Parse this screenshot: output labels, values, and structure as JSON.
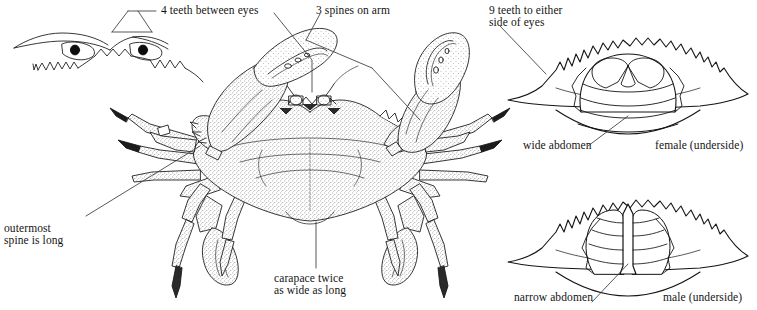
{
  "figure": {
    "background_color": "#ffffff",
    "ink_color": "#141414"
  },
  "labels": {
    "teeth_between_eyes": "4 teeth between eyes",
    "spines_on_arm": "3 spines on arm",
    "teeth_either_side_line1": "9 teeth to either",
    "teeth_either_side_line2": "side of eyes",
    "outermost_spine_line1": "outermost",
    "outermost_spine_line2": "spine is long",
    "carapace_line1": "carapace twice",
    "carapace_line2": "as wide as long",
    "wide_abdomen": "wide abdomen",
    "female_underside": "female (underside)",
    "narrow_abdomen": "narrow abdomen",
    "male_underside": "male (underside)"
  },
  "diagrams": {
    "eye_detail": "eye-and-frontal-teeth-detail",
    "main_crab": "dorsal-view-blue-crab",
    "female_underside": "female-carapace-underside-wide-abdomen",
    "male_underside": "male-carapace-underside-narrow-abdomen"
  }
}
